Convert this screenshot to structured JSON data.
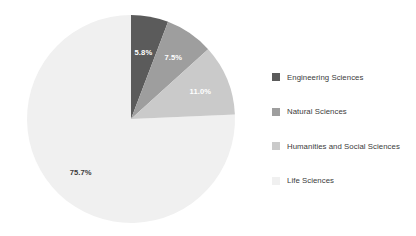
{
  "chart_data": {
    "type": "pie",
    "title": "",
    "subtitle": "",
    "xlabel": "",
    "ylabel": "",
    "grid": false,
    "legend_position": "right",
    "start_angle_deg": 0,
    "direction": "clockwise",
    "categories": [
      "Engineering Sciences",
      "Natural Sciences",
      "Humanities and Social Sciences",
      "Life Sciences"
    ],
    "values": [
      5.8,
      7.5,
      11.0,
      75.7
    ],
    "data_labels": [
      "5.8%",
      "7.5%",
      "11.0%",
      "75.7%"
    ],
    "colors": [
      "#5b5b5b",
      "#9e9e9e",
      "#cacaca",
      "#f0f0f0"
    ],
    "label_colors": [
      "#ffffff",
      "#ffffff",
      "#ffffff",
      "#3b3b3b"
    ],
    "units": "percent"
  },
  "legend": {
    "items": [
      {
        "label": "Engineering Sciences",
        "color": "#5b5b5b"
      },
      {
        "label": "Natural Sciences",
        "color": "#9e9e9e"
      },
      {
        "label": "Humanities and Social Sciences",
        "color": "#cacaca"
      },
      {
        "label": "Life Sciences",
        "color": "#f0f0f0"
      }
    ]
  },
  "slice_labels": {
    "engineering": "5.8%",
    "natural": "7.5%",
    "humanities": "11.0%",
    "life": "75.7%"
  }
}
